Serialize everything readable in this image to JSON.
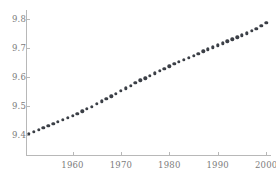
{
  "chart_data": {
    "type": "scatter",
    "title": "",
    "subtitle": "",
    "xlabel": "",
    "ylabel": "",
    "xlim": [
      1950.5,
      2001
    ],
    "ylim": [
      9.33,
      9.83
    ],
    "grid": false,
    "legend": null,
    "annotations": [],
    "marker": {
      "shape": "circle",
      "color": "#3b3f46",
      "size": 3.4
    },
    "axis_color": "#b8b8b8",
    "tick_label_color": "#7c7c7c",
    "xticks": [
      1960,
      1970,
      1980,
      1990,
      2000
    ],
    "xtick_labels": [
      "1960",
      "1970",
      "1980",
      "1990",
      "2000"
    ],
    "yticks": [
      9.4,
      9.5,
      9.6,
      9.7,
      9.8
    ],
    "ytick_labels": [
      "9.4",
      "9.5",
      "9.6",
      "9.7",
      "9.8"
    ],
    "x": [
      1951,
      1952,
      1953,
      1954,
      1955,
      1956,
      1957,
      1958,
      1959,
      1960,
      1961,
      1962,
      1963,
      1964,
      1965,
      1966,
      1967,
      1968,
      1969,
      1970,
      1971,
      1972,
      1973,
      1974,
      1975,
      1976,
      1977,
      1978,
      1979,
      1980,
      1981,
      1982,
      1983,
      1984,
      1985,
      1986,
      1987,
      1988,
      1989,
      1990,
      1991,
      1992,
      1993,
      1994,
      1995,
      1996,
      1997,
      1998,
      1999,
      2000
    ],
    "y": [
      9.404,
      9.41,
      9.416,
      9.423,
      9.43,
      9.437,
      9.444,
      9.451,
      9.458,
      9.465,
      9.473,
      9.481,
      9.489,
      9.497,
      9.506,
      9.515,
      9.524,
      9.533,
      9.542,
      9.551,
      9.56,
      9.569,
      9.578,
      9.587,
      9.595,
      9.604,
      9.612,
      9.62,
      9.628,
      9.636,
      9.644,
      9.652,
      9.659,
      9.666,
      9.673,
      9.68,
      9.687,
      9.694,
      9.701,
      9.708,
      9.715,
      9.722,
      9.729,
      9.736,
      9.743,
      9.75,
      9.758,
      9.766,
      9.775,
      9.786
    ]
  }
}
